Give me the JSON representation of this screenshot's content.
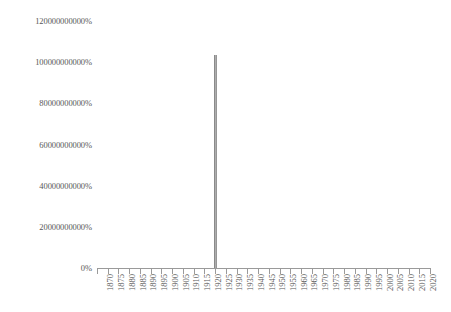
{
  "chart_data": {
    "type": "line",
    "title": "",
    "subtitle": "",
    "xlabel": "",
    "ylabel": "",
    "grid": false,
    "legend": false,
    "legend_position": "none",
    "x_tick_labels": [
      "1870",
      "1875",
      "1880",
      "1885",
      "1890",
      "1895",
      "1900",
      "1905",
      "1910",
      "1915",
      "1920",
      "1925",
      "1930",
      "1935",
      "1940",
      "1945",
      "1950",
      "1955",
      "1960",
      "1965",
      "1970",
      "1975",
      "1980",
      "1985",
      "1990",
      "1995",
      "2000",
      "2005",
      "2010",
      "2015",
      "2020"
    ],
    "y_tick_labels": [
      "0%",
      "20000000000%",
      "40000000000%",
      "60000000000%",
      "80000000000%",
      "100000000000%",
      "120000000000%"
    ],
    "y_tick_values": [
      0,
      20000000000,
      40000000000,
      60000000000,
      80000000000,
      100000000000,
      120000000000
    ],
    "ylim": [
      0,
      120000000000
    ],
    "xlim": [
      1870,
      2023
    ],
    "x_axis_value_suffix": "%",
    "series": [
      {
        "name": "",
        "color": "#8a8a8a",
        "x": [
          1870,
          1875,
          1880,
          1885,
          1890,
          1895,
          1900,
          1905,
          1910,
          1915,
          1920,
          1922,
          1923,
          1924,
          1925,
          1930,
          1935,
          1940,
          1945,
          1950,
          1955,
          1960,
          1965,
          1970,
          1975,
          1980,
          1985,
          1990,
          1995,
          2000,
          2005,
          2010,
          2015,
          2020
        ],
        "values": [
          0,
          0,
          0,
          0,
          0,
          0,
          0,
          0,
          0,
          0,
          0,
          0,
          104000000000,
          0,
          0,
          0,
          0,
          0,
          0,
          0,
          0,
          0,
          0,
          0,
          0,
          0,
          0,
          0,
          0,
          0,
          0,
          0,
          0,
          0
        ]
      }
    ],
    "peak": {
      "x": 1923,
      "value": 104000000000,
      "label": "104000000000%"
    }
  },
  "colors": {
    "series": "#8a8a8a",
    "axis": "#9a9a9a",
    "text": "#585858",
    "background": "#ffffff"
  }
}
